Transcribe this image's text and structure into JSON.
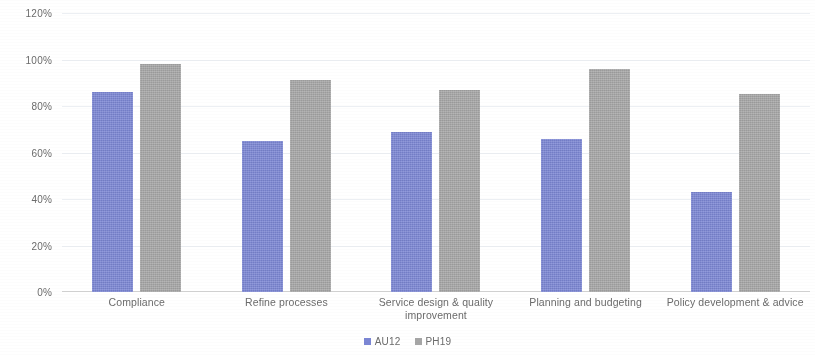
{
  "chart_data": {
    "type": "bar",
    "title": "",
    "subtitle": "",
    "xlabel": "",
    "ylabel": "",
    "categories": [
      "Compliance",
      "Refine processes",
      "Service design & quality improvement",
      "Planning and budgeting",
      "Policy development & advice"
    ],
    "series": [
      {
        "name": "AU12",
        "color": "#7b86d4",
        "values": [
          86,
          65,
          69,
          66,
          43
        ]
      },
      {
        "name": "PH19",
        "color": "#a6a6a6",
        "values": [
          98,
          91,
          87,
          96,
          85
        ]
      }
    ],
    "ylim": [
      0,
      120
    ],
    "ytick_values": [
      0,
      20,
      40,
      60,
      80,
      100,
      120
    ],
    "ytick_labels": [
      "0%",
      "20%",
      "40%",
      "60%",
      "80%",
      "100%",
      "120%"
    ],
    "grid": true,
    "legend_position": "bottom"
  },
  "axis": {
    "ticks": [
      {
        "label": "120%",
        "value": 120
      },
      {
        "label": "100%",
        "value": 100
      },
      {
        "label": "80%",
        "value": 80
      },
      {
        "label": "60%",
        "value": 60
      },
      {
        "label": "40%",
        "value": 40
      },
      {
        "label": "20%",
        "value": 20
      },
      {
        "label": "0%",
        "value": 0
      }
    ]
  },
  "legend": {
    "items": [
      {
        "label": "AU12",
        "color": "#7b86d4"
      },
      {
        "label": "PH19",
        "color": "#a6a6a6"
      }
    ]
  }
}
